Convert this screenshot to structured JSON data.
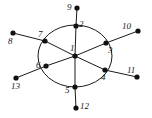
{
  "figure": {
    "type": "graph-diagram",
    "background_color": "#ffffff",
    "stroke_color": "#1a1a1a",
    "node_fill_color": "#111111",
    "node_radius": 2.6,
    "edge_width": 1.0,
    "ellipse": {
      "cx": 75,
      "cy": 56,
      "rx": 37,
      "ry": 31
    },
    "nodes": [
      {
        "id": "1",
        "label": "1",
        "x": 75,
        "y": 56,
        "label_x": 70,
        "label_y": 44
      },
      {
        "id": "2",
        "label": "2",
        "x": 76,
        "y": 26,
        "label_x": 79,
        "label_y": 20
      },
      {
        "id": "3",
        "label": "3",
        "x": 106,
        "y": 43,
        "label_x": 108,
        "label_y": 46
      },
      {
        "id": "4",
        "label": "4",
        "x": 105,
        "y": 70,
        "label_x": 101,
        "label_y": 73
      },
      {
        "id": "5",
        "label": "5",
        "x": 75,
        "y": 87,
        "label_x": 65,
        "label_y": 86
      },
      {
        "id": "6",
        "label": "6",
        "x": 46,
        "y": 66,
        "label_x": 36,
        "label_y": 61
      },
      {
        "id": "7",
        "label": "7",
        "x": 45,
        "y": 41,
        "label_x": 38,
        "label_y": 30
      },
      {
        "id": "8",
        "label": "8",
        "x": 13,
        "y": 33,
        "label_x": 8,
        "label_y": 37
      },
      {
        "id": "9",
        "label": "9",
        "x": 77,
        "y": 8,
        "label_x": 67,
        "label_y": 3
      },
      {
        "id": "10",
        "label": "10",
        "x": 138,
        "y": 31,
        "label_x": 122,
        "label_y": 22
      },
      {
        "id": "11",
        "label": "11",
        "x": 137,
        "y": 77,
        "label_x": 127,
        "label_y": 66
      },
      {
        "id": "12",
        "label": "12",
        "x": 76,
        "y": 108,
        "label_x": 80,
        "label_y": 102
      },
      {
        "id": "13",
        "label": "13",
        "x": 16,
        "y": 78,
        "label_x": 11,
        "label_y": 82
      }
    ],
    "edges": [
      {
        "from": "1",
        "to": "2",
        "kind": "straight"
      },
      {
        "from": "1",
        "to": "3",
        "kind": "straight"
      },
      {
        "from": "1",
        "to": "4",
        "kind": "straight"
      },
      {
        "from": "1",
        "to": "5",
        "kind": "straight"
      },
      {
        "from": "1",
        "to": "6",
        "kind": "straight"
      },
      {
        "from": "1",
        "to": "7",
        "kind": "straight"
      },
      {
        "from": "2",
        "to": "9",
        "kind": "straight"
      },
      {
        "from": "3",
        "to": "10",
        "kind": "straight"
      },
      {
        "from": "4",
        "to": "11",
        "kind": "straight"
      },
      {
        "from": "5",
        "to": "12",
        "kind": "straight"
      },
      {
        "from": "6",
        "to": "13",
        "kind": "straight"
      },
      {
        "from": "7",
        "to": "8",
        "kind": "straight"
      },
      {
        "from": "2",
        "to": "3",
        "kind": "arc"
      },
      {
        "from": "3",
        "to": "4",
        "kind": "arc"
      },
      {
        "from": "4",
        "to": "5",
        "kind": "arc"
      },
      {
        "from": "5",
        "to": "6",
        "kind": "arc"
      },
      {
        "from": "6",
        "to": "7",
        "kind": "arc"
      },
      {
        "from": "7",
        "to": "2",
        "kind": "arc"
      }
    ]
  }
}
